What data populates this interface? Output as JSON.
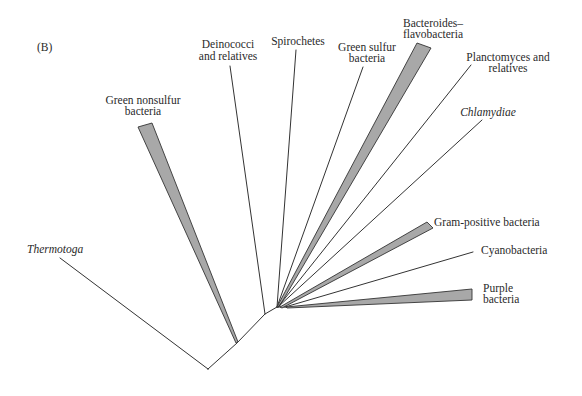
{
  "panel_label": "(B)",
  "colors": {
    "branch_line": "#333333",
    "wedge_fill": "#a8a8a8",
    "text": "#2a2a2a",
    "background": "#ffffff"
  },
  "tree": {
    "structure": "(Thermotoga,(Green nonsulfur bacteria,(Deinococci and relatives,(Spirochetes,Green sulfur bacteria,Bacteroides–flavobacteria,Planctomyces and relatives,Chlamydiae,(Gram-positive bacteria,Cyanobacteria,Purple bacteria)))))",
    "taxa": [
      {
        "id": "thermotoga",
        "label_lines": [
          "Thermotoga"
        ],
        "italic": true,
        "shape": "line"
      },
      {
        "id": "green-nonsulfur",
        "label_lines": [
          "Green nonsulfur",
          "bacteria"
        ],
        "italic": false,
        "shape": "wedge"
      },
      {
        "id": "deinococci",
        "label_lines": [
          "Deinococci",
          "and relatives"
        ],
        "italic": false,
        "shape": "line"
      },
      {
        "id": "spirochetes",
        "label_lines": [
          "Spirochetes"
        ],
        "italic": false,
        "shape": "line"
      },
      {
        "id": "green-sulfur",
        "label_lines": [
          "Green sulfur",
          "bacteria"
        ],
        "italic": false,
        "shape": "line"
      },
      {
        "id": "bacteroides",
        "label_lines": [
          "Bacteroides–",
          "flavobacteria"
        ],
        "italic": false,
        "shape": "wedge"
      },
      {
        "id": "planctomyces",
        "label_lines": [
          "Planctomyces and",
          "relatives"
        ],
        "italic": false,
        "shape": "line"
      },
      {
        "id": "chlamydiae",
        "label_lines": [
          "Chlamydiae"
        ],
        "italic": true,
        "shape": "line"
      },
      {
        "id": "gram-positive",
        "label_lines": [
          "Gram-positive bacteria"
        ],
        "italic": false,
        "shape": "wedge"
      },
      {
        "id": "cyanobacteria",
        "label_lines": [
          "Cyanobacteria"
        ],
        "italic": false,
        "shape": "line"
      },
      {
        "id": "purple",
        "label_lines": [
          "Purple",
          "bacteria"
        ],
        "italic": false,
        "shape": "wedge"
      }
    ]
  }
}
